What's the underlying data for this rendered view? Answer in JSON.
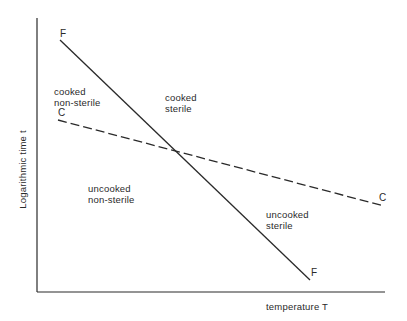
{
  "diagram": {
    "type": "phase-diagram",
    "axes": {
      "x_label": "temperature T",
      "y_label": "Logarithmic time t"
    },
    "lines": [
      {
        "id": "F",
        "style": "solid",
        "start_label": "F",
        "end_label": "F",
        "description": "sterilization line (steep)"
      },
      {
        "id": "C",
        "style": "dashed",
        "start_label": "C",
        "end_label": "C",
        "description": "cooking line (shallow)"
      }
    ],
    "regions": {
      "cooked_non_sterile": {
        "line1": "cooked",
        "line2": "non-sterile"
      },
      "cooked_sterile": {
        "line1": "cooked",
        "line2": "sterile"
      },
      "uncooked_non_sterile": {
        "line1": "uncooked",
        "line2": "non-sterile"
      },
      "uncooked_sterile": {
        "line1": "uncooked",
        "line2": "sterile"
      }
    },
    "colors": {
      "ink": "#2a2a2a",
      "background": "#ffffff"
    }
  }
}
